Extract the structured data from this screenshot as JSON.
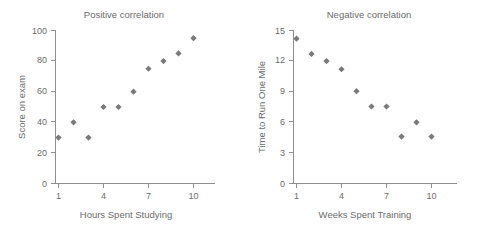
{
  "figure": {
    "background_color": "#ffffff",
    "marker_color": "#7a7a7a",
    "axis_color": "#8f8f8f",
    "text_color": "#6b6b6b"
  },
  "panels": [
    {
      "key": "positive",
      "title": "Positive correlation",
      "xlabel": "Hours Spent Studying",
      "ylabel": "Score on exam",
      "x_ticks": [
        "1",
        "4",
        "7",
        "10"
      ],
      "y_ticks": [
        "0",
        "20",
        "40",
        "60",
        "80",
        "100"
      ]
    },
    {
      "key": "negative",
      "title": "Negative correlation",
      "xlabel": "Weeks Spent Training",
      "ylabel": "Time to Run One Mile",
      "x_ticks": [
        "1",
        "4",
        "7",
        "10"
      ],
      "y_ticks": [
        "0",
        "3",
        "6",
        "9",
        "12",
        "15"
      ]
    }
  ],
  "chart_data": [
    {
      "type": "scatter",
      "title": "Positive correlation",
      "xlabel": "Hours Spent Studying",
      "ylabel": "Score on exam",
      "xlim": [
        0.4,
        10.8
      ],
      "ylim": [
        0,
        100
      ],
      "xticks": [
        1,
        4,
        7,
        10
      ],
      "yticks": [
        0,
        20,
        40,
        60,
        80,
        100
      ],
      "grid": false,
      "legend": null,
      "x": [
        1,
        2,
        3,
        4,
        5,
        6,
        7,
        8,
        9,
        10
      ],
      "y": [
        30,
        40,
        30,
        50,
        50,
        60,
        75,
        80,
        85,
        95
      ]
    },
    {
      "type": "scatter",
      "title": "Negative correlation",
      "xlabel": "Weeks Spent Training",
      "ylabel": "Time to Run One Mile",
      "xlim": [
        0.4,
        10.8
      ],
      "ylim": [
        0,
        15
      ],
      "xticks": [
        1,
        4,
        7,
        10
      ],
      "yticks": [
        0,
        3,
        6,
        9,
        12,
        15
      ],
      "grid": false,
      "legend": null,
      "x": [
        1,
        2,
        3,
        4,
        5,
        6,
        7,
        8,
        9,
        10
      ],
      "y": [
        14.2,
        12.7,
        12.0,
        11.2,
        9.05,
        7.55,
        7.55,
        4.6,
        6.0,
        4.6
      ]
    }
  ]
}
